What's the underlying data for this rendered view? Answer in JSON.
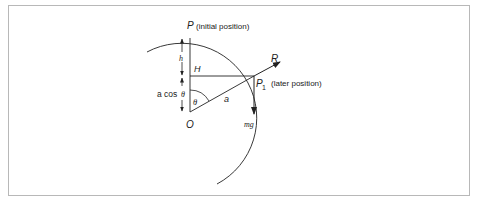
{
  "diagram": {
    "labels": {
      "p": "P",
      "p_note": "(initial position)",
      "p1": "P",
      "p1_sub": "1",
      "p1_note": "(later position)",
      "r": "R",
      "h_upper": "H",
      "h_lower": "h",
      "a_cos_prefix": "a cos",
      "theta": "θ",
      "theta_angle": "θ",
      "a": "a",
      "o": "O",
      "mg": "mg"
    },
    "colors": {
      "stroke": "#222222",
      "border": "#b8b8b8"
    }
  }
}
